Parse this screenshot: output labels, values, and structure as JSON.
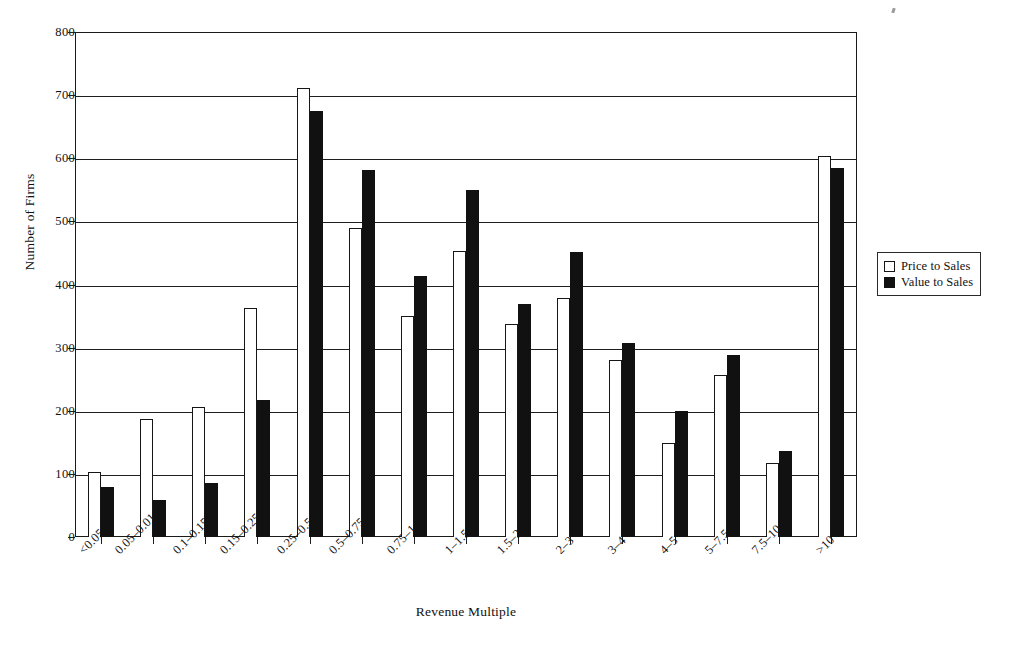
{
  "chart_data": {
    "type": "bar",
    "title": "",
    "xlabel": "Revenue Multiple",
    "ylabel": "Number of Firms",
    "ylim": [
      0,
      800
    ],
    "ytick_step": 100,
    "yticks": [
      "800",
      "700",
      "600",
      "500",
      "400",
      "300",
      "200",
      "100",
      "0"
    ],
    "ytick_values": [
      800,
      700,
      600,
      500,
      400,
      300,
      200,
      100,
      0
    ],
    "grid": "horizontal",
    "legend_position": "right",
    "categories": [
      "<0.05",
      "0.05–0.01",
      "0.1–0.15",
      "0.15–0.25",
      "0.25–0.5",
      "0.5–0.75",
      "0.75–1",
      "1–1.5",
      "1.5–2",
      "2–3",
      "3–4",
      "4–5",
      "5–7.5",
      "7.5–10",
      ">10"
    ],
    "series": [
      {
        "name": "Price to Sales",
        "color": "#ffffff",
        "edge_color": "#161616",
        "values": [
          103,
          187,
          206,
          363,
          712,
          490,
          350,
          453,
          337,
          378,
          280,
          149,
          257,
          118,
          603
        ]
      },
      {
        "name": "Value to Sales",
        "color": "#111111",
        "edge_color": "#111111",
        "values": [
          79,
          59,
          85,
          217,
          675,
          582,
          413,
          549,
          369,
          451,
          307,
          200,
          288,
          136,
          584
        ]
      }
    ]
  },
  "legend": {
    "items": [
      {
        "label": "Price to Sales",
        "swatch": "hollow-square"
      },
      {
        "label": "Value to Sales",
        "swatch": "filled-square"
      }
    ]
  }
}
